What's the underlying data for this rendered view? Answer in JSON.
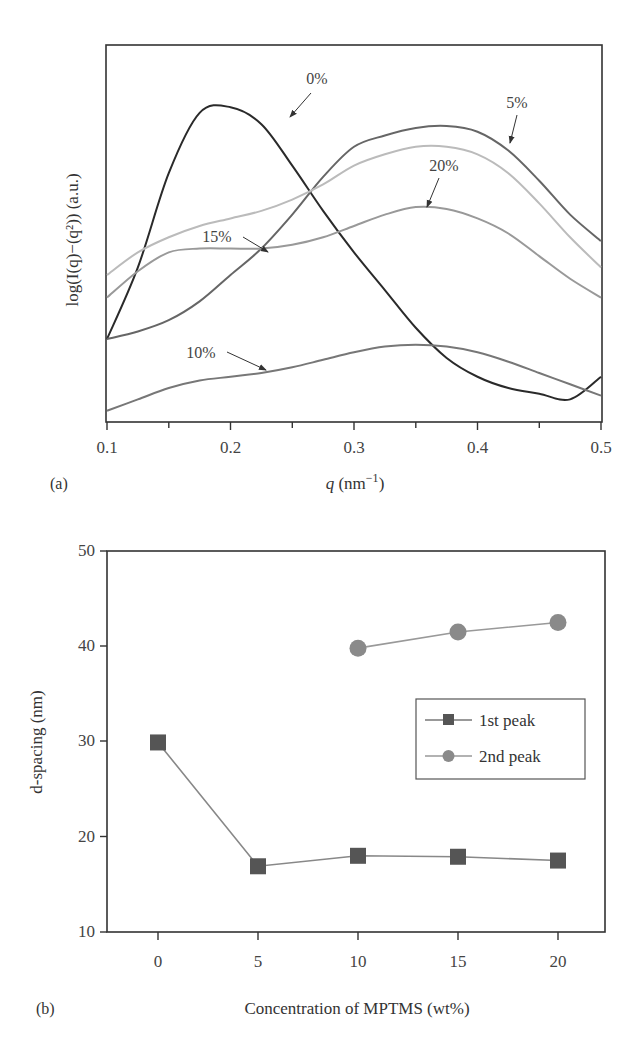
{
  "chart_data": [
    {
      "panel": "(a)",
      "type": "line",
      "title": "",
      "xlabel": "q (nm⁻¹)",
      "ylabel": "log(I(q)−(q²)) (a.u.)",
      "xlim": [
        0.1,
        0.5
      ],
      "xticks": [
        "0.1",
        "0.2",
        "0.3",
        "0.4",
        "0.5"
      ],
      "ylim": [
        0,
        1
      ],
      "yticks": [],
      "grid": false,
      "legend": "none (curves labeled with arrows)",
      "x": [
        0.1,
        0.125,
        0.15,
        0.175,
        0.2,
        0.225,
        0.25,
        0.275,
        0.3,
        0.325,
        0.35,
        0.375,
        0.4,
        0.425,
        0.45,
        0.475,
        0.5
      ],
      "series": [
        {
          "name": "0%",
          "color": "#2a2a2a",
          "values": [
            0.22,
            0.41,
            0.66,
            0.82,
            0.835,
            0.79,
            0.68,
            0.56,
            0.45,
            0.35,
            0.25,
            0.17,
            0.12,
            0.09,
            0.075,
            0.06,
            0.12
          ]
        },
        {
          "name": "5%",
          "color": "#666666",
          "values": [
            0.22,
            0.24,
            0.27,
            0.32,
            0.39,
            0.46,
            0.55,
            0.65,
            0.73,
            0.76,
            0.78,
            0.785,
            0.77,
            0.72,
            0.64,
            0.55,
            0.48
          ]
        },
        {
          "name": "10%",
          "color": "#777777",
          "values": [
            0.03,
            0.06,
            0.09,
            0.11,
            0.12,
            0.13,
            0.145,
            0.165,
            0.185,
            0.2,
            0.205,
            0.2,
            0.185,
            0.16,
            0.13,
            0.1,
            0.07
          ]
        },
        {
          "name": "15%",
          "color": "#bbbbbb",
          "values": [
            0.39,
            0.45,
            0.49,
            0.52,
            0.54,
            0.56,
            0.59,
            0.63,
            0.68,
            0.71,
            0.73,
            0.73,
            0.71,
            0.66,
            0.58,
            0.49,
            0.41
          ]
        },
        {
          "name": "20%",
          "color": "#999999",
          "values": [
            0.33,
            0.4,
            0.45,
            0.46,
            0.46,
            0.46,
            0.47,
            0.49,
            0.52,
            0.55,
            0.57,
            0.565,
            0.54,
            0.5,
            0.44,
            0.38,
            0.33
          ]
        }
      ],
      "annotations": [
        {
          "text": "0%",
          "arrow_to_q": 0.245
        },
        {
          "text": "5%",
          "arrow_to_q": 0.42
        },
        {
          "text": "10%",
          "arrow_to_q": 0.23
        },
        {
          "text": "15%",
          "arrow_to_q": 0.23
        },
        {
          "text": "20%",
          "arrow_to_q": 0.36
        }
      ]
    },
    {
      "panel": "(b)",
      "type": "line",
      "title": "",
      "xlabel": "Concentration of MPTMS (wt%)",
      "ylabel": "d-spacing (nm)",
      "xlim": [
        -2.5,
        22.5
      ],
      "xticks": [
        "0",
        "5",
        "10",
        "15",
        "20"
      ],
      "ylim": [
        10,
        50
      ],
      "yticks": [
        "10",
        "20",
        "30",
        "40",
        "50"
      ],
      "grid": false,
      "legend_position": "center-right",
      "series": [
        {
          "name": "1st peak",
          "marker": "square",
          "color": "#555555",
          "line_color": "#888888",
          "x": [
            0,
            5,
            10,
            15,
            20
          ],
          "values": [
            29.9,
            16.9,
            18.0,
            17.9,
            17.5
          ]
        },
        {
          "name": "2nd peak",
          "marker": "circle",
          "color": "#8a8a8a",
          "line_color": "#999999",
          "x": [
            10,
            15,
            20
          ],
          "values": [
            39.8,
            41.5,
            42.5
          ]
        }
      ]
    }
  ],
  "panel_a": {
    "label": "(a)",
    "ylabel": "log(I(q)−(q²)) (a.u.)",
    "xlabel_var": "q",
    "xlabel_unit": " (nm",
    "xlabel_exp": "−1",
    "xlabel_close": ")",
    "xticks": [
      "0.1",
      "0.2",
      "0.3",
      "0.4",
      "0.5"
    ],
    "curve_labels": {
      "p0": "0%",
      "p5": "5%",
      "p10": "10%",
      "p15": "15%",
      "p20": "20%"
    }
  },
  "panel_b": {
    "label": "(b)",
    "ylabel": "d-spacing (nm)",
    "xlabel": "Concentration of MPTMS (wt%)",
    "xticks": [
      "0",
      "5",
      "10",
      "15",
      "20"
    ],
    "yticks": [
      "10",
      "20",
      "30",
      "40",
      "50"
    ],
    "legend": {
      "first": "1st peak",
      "second": "2nd peak"
    }
  }
}
